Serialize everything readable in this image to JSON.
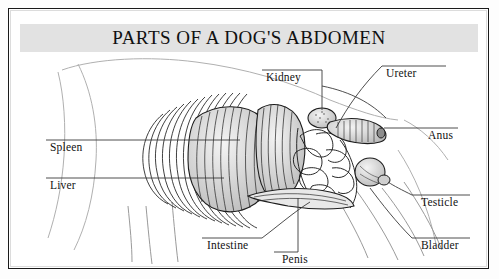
{
  "document": {
    "title": "PARTS OF A DOG'S ABDOMEN",
    "type": "anatomical-illustration",
    "subject": "dog abdomen, lateral cutaway view",
    "style": "black and white pen-and-ink engraving",
    "banner_color": "#e2e2e2",
    "frame_color": "#1a1a1a",
    "background_color": "#ffffff",
    "ink_color": "#1d1d1d"
  },
  "labels": [
    {
      "id": "kidney",
      "text": "Kidney",
      "x": 266,
      "y": 78,
      "side": "top"
    },
    {
      "id": "ureter",
      "text": "Ureter",
      "x": 386,
      "y": 74,
      "side": "top-right"
    },
    {
      "id": "anus",
      "text": "Anus",
      "x": 428,
      "y": 133,
      "side": "right"
    },
    {
      "id": "testicle",
      "text": "Testicle",
      "x": 421,
      "y": 203,
      "side": "right"
    },
    {
      "id": "bladder",
      "text": "Bladder",
      "x": 421,
      "y": 246,
      "side": "right"
    },
    {
      "id": "spleen",
      "text": "Spleen",
      "x": 50,
      "y": 148,
      "side": "left"
    },
    {
      "id": "liver",
      "text": "Liver",
      "x": 50,
      "y": 186,
      "side": "left"
    },
    {
      "id": "intestine",
      "text": "Intestine",
      "x": 207,
      "y": 246,
      "side": "bottom"
    },
    {
      "id": "penis",
      "text": "Penis",
      "x": 282,
      "y": 259,
      "side": "bottom"
    }
  ],
  "leader_lines": [
    {
      "id": "kidney-leader",
      "path": "M262,70 L322,70"
    },
    {
      "id": "kidney-stem",
      "path": "M322,70 L322,118"
    },
    {
      "id": "kidney-curve",
      "path": "M322,86 C352,92 372,104 386,118"
    },
    {
      "id": "ureter-leader",
      "path": "M382,66 L446,66"
    },
    {
      "id": "ureter-curve",
      "path": "M382,66 C362,86 346,104 334,126"
    },
    {
      "id": "anus-leader",
      "path": "M380,128 L458,128"
    },
    {
      "id": "testicle-leader",
      "path": "M412,195 L470,195"
    },
    {
      "id": "testicle-curve",
      "path": "M412,195 C400,190 392,186 384,182"
    },
    {
      "id": "bladder-leader",
      "path": "M412,238 L470,238"
    },
    {
      "id": "bladder-curve",
      "path": "M412,238 C396,224 380,206 366,190"
    },
    {
      "id": "spleen-leader",
      "path": "M46,140 L232,140"
    },
    {
      "id": "liver-leader",
      "path": "M46,178 L216,178"
    },
    {
      "id": "intestine-leader",
      "path": "M202,238 L262,238"
    },
    {
      "id": "intestine-curve",
      "path": "M262,238 C276,226 292,214 306,204"
    },
    {
      "id": "penis-stem",
      "path": "M298,250 L298,196"
    },
    {
      "id": "penis-tick",
      "path": "M276,250 L298,250"
    }
  ],
  "anatomy_parts": [
    {
      "id": "rib-cage",
      "name": "rib cage",
      "render": "fan of curved arcs"
    },
    {
      "id": "liver-mass",
      "name": "liver",
      "render": "large hatched lobed mass"
    },
    {
      "id": "spleen-mass",
      "name": "spleen",
      "render": "hatched elongated organ"
    },
    {
      "id": "intestines",
      "name": "intestine",
      "render": "coiled loops"
    },
    {
      "id": "kidney-organ",
      "name": "kidney",
      "render": "bean-shaped stippled organ"
    },
    {
      "id": "colon",
      "name": "colon",
      "render": "banded tube to anus"
    },
    {
      "id": "bladder-organ",
      "name": "bladder",
      "render": "rounded sac"
    },
    {
      "id": "body-outline",
      "name": "body outline",
      "render": "faint grey contour"
    },
    {
      "id": "hind-legs",
      "name": "hind legs",
      "render": "diagonal contour lines"
    }
  ]
}
